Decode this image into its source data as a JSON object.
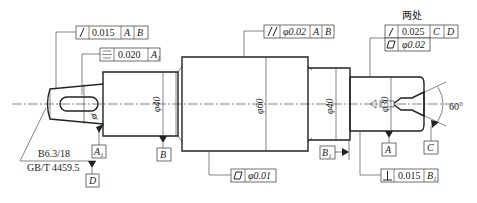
{
  "callouts": {
    "runout_left": {
      "symbol": "circular-runout",
      "value": "0.015",
      "datums": [
        "A",
        "B"
      ]
    },
    "symmetry": {
      "symbol": "symmetry",
      "value": "0.020",
      "datums": [
        "A1"
      ]
    },
    "parallel": {
      "symbol": "parallelism",
      "value": "φ0.02",
      "datums": [
        "A",
        "B"
      ]
    },
    "cylindricity_mid": {
      "symbol": "cylindricity",
      "value": "φ0.01"
    },
    "right_note": "两处",
    "runout_right": {
      "symbol": "circular-runout",
      "value": "0.025",
      "datums": [
        "C",
        "D"
      ]
    },
    "cylindricity_right": {
      "symbol": "cylindricity",
      "value": "φ0.02"
    },
    "perpendicular": {
      "symbol": "perpendicularity",
      "value": "0.015",
      "datums": [
        "B1"
      ]
    }
  },
  "dimensions": {
    "d1": "φ40",
    "d2": "φ60",
    "d3": "φ40",
    "d4": "φ30",
    "angle": "60°"
  },
  "datums": {
    "A1": "A1",
    "B": "B",
    "D": "D",
    "A": "A",
    "B1": "B1",
    "C": "C"
  },
  "notes": {
    "center_hole": "B6.3/18",
    "standard": "GB/T 4459.5"
  }
}
